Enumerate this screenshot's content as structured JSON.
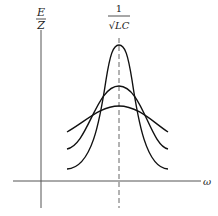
{
  "diagram": {
    "type": "resonance-curves",
    "y_label_top": "E",
    "y_label_bottom": "Z",
    "x_label": "ω",
    "resonance_label_numerator": "1",
    "resonance_label_denominator": "√LC",
    "curves": [
      {
        "name": "sharp",
        "peak_y": 45,
        "base_y": 169
      },
      {
        "name": "medium",
        "peak_y": 86,
        "base_y": 149
      },
      {
        "name": "broad",
        "peak_y": 106,
        "base_y": 132
      }
    ]
  }
}
